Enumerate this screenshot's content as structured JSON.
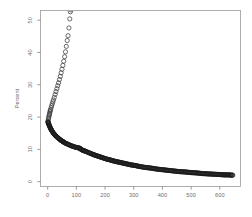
{
  "figure": {
    "width": 252,
    "height": 217,
    "background": "#ffffff",
    "type": "r-base-graphics-scatter"
  },
  "chart_data": {
    "type": "scatter",
    "title": "",
    "subtitle": "",
    "xlabel": "",
    "ylabel": "Percent",
    "xlim": [
      -25,
      672
    ],
    "ylim": [
      -1.5,
      53
    ],
    "grid": false,
    "legend": null,
    "legend_position": "none",
    "xticks": [
      0,
      100,
      200,
      300,
      400,
      500,
      600
    ],
    "xticklabels": [
      "0",
      "100",
      "200",
      "300",
      "400",
      "500",
      "600"
    ],
    "yticks": [
      0,
      10,
      20,
      30,
      40,
      50
    ],
    "yticklabels": [
      "0",
      "10",
      "20",
      "30",
      "40",
      "50"
    ],
    "marker": "open-circle",
    "marker_size": 2.1,
    "marker_color": "#3a3a3a",
    "annotations": [],
    "series": [
      {
        "name": "upper-branch",
        "description": "sparse open circles rising steeply from the elbow toward the top of the panel, clipped at the top edge",
        "color": "#3a3a3a",
        "points": [
          [
            1,
            18.6
          ],
          [
            2,
            19.1
          ],
          [
            3,
            19.6
          ],
          [
            4,
            20.0
          ],
          [
            5,
            20.4
          ],
          [
            6,
            20.8
          ],
          [
            7,
            21.2
          ],
          [
            8,
            21.6
          ],
          [
            9,
            22.0
          ],
          [
            10,
            22.3
          ],
          [
            12,
            22.9
          ],
          [
            14,
            23.5
          ],
          [
            16,
            24.1
          ],
          [
            18,
            24.7
          ],
          [
            20,
            25.3
          ],
          [
            23,
            26.1
          ],
          [
            26,
            27.0
          ],
          [
            29,
            27.9
          ],
          [
            32,
            28.8
          ],
          [
            35,
            29.7
          ],
          [
            38,
            30.6
          ],
          [
            41,
            31.6
          ],
          [
            44,
            32.6
          ],
          [
            47,
            33.7
          ],
          [
            50,
            34.8
          ],
          [
            53,
            36.0
          ],
          [
            56,
            37.3
          ],
          [
            59,
            38.7
          ],
          [
            62,
            40.2
          ],
          [
            65,
            41.9
          ],
          [
            68,
            43.7
          ],
          [
            71,
            45.2
          ],
          [
            74,
            47.6
          ],
          [
            77,
            50.4
          ],
          [
            79,
            52.6
          ],
          [
            81,
            53.2
          ]
        ]
      },
      {
        "name": "lower-branch",
        "description": "dense overlapping open circles forming a thick dark monotonically decaying curve from the elbow to the right edge, with a small kink near x=115",
        "color": "#1a1a1a",
        "points": [
          [
            1,
            18.5
          ],
          [
            3,
            18.0
          ],
          [
            5,
            17.5
          ],
          [
            7,
            17.1
          ],
          [
            9,
            16.7
          ],
          [
            11,
            16.3
          ],
          [
            13,
            16.0
          ],
          [
            15,
            15.7
          ],
          [
            18,
            15.3
          ],
          [
            21,
            14.9
          ],
          [
            24,
            14.6
          ],
          [
            27,
            14.3
          ],
          [
            30,
            14.0
          ],
          [
            34,
            13.7
          ],
          [
            38,
            13.4
          ],
          [
            42,
            13.1
          ],
          [
            46,
            12.8
          ],
          [
            50,
            12.6
          ],
          [
            55,
            12.3
          ],
          [
            60,
            12.0
          ],
          [
            65,
            11.8
          ],
          [
            70,
            11.6
          ],
          [
            75,
            11.4
          ],
          [
            80,
            11.2
          ],
          [
            85,
            11.0
          ],
          [
            90,
            10.9
          ],
          [
            95,
            10.7
          ],
          [
            100,
            10.6
          ],
          [
            105,
            10.5
          ],
          [
            110,
            10.4
          ],
          [
            113,
            10.3
          ],
          [
            116,
            10.0
          ],
          [
            120,
            9.8
          ],
          [
            126,
            9.6
          ],
          [
            132,
            9.4
          ],
          [
            140,
            9.1
          ],
          [
            148,
            8.8
          ],
          [
            156,
            8.5
          ],
          [
            165,
            8.2
          ],
          [
            175,
            7.9
          ],
          [
            185,
            7.6
          ],
          [
            195,
            7.3
          ],
          [
            205,
            7.0
          ],
          [
            215,
            6.8
          ],
          [
            230,
            6.4
          ],
          [
            245,
            6.1
          ],
          [
            260,
            5.8
          ],
          [
            275,
            5.5
          ],
          [
            290,
            5.2
          ],
          [
            305,
            5.0
          ],
          [
            320,
            4.7
          ],
          [
            340,
            4.4
          ],
          [
            360,
            4.2
          ],
          [
            380,
            3.9
          ],
          [
            400,
            3.7
          ],
          [
            420,
            3.5
          ],
          [
            440,
            3.3
          ],
          [
            460,
            3.1
          ],
          [
            480,
            3.0
          ],
          [
            500,
            2.8
          ],
          [
            520,
            2.7
          ],
          [
            540,
            2.5
          ],
          [
            560,
            2.4
          ],
          [
            580,
            2.3
          ],
          [
            600,
            2.2
          ],
          [
            615,
            2.1
          ],
          [
            630,
            2.1
          ],
          [
            645,
            2.0
          ]
        ]
      }
    ]
  }
}
